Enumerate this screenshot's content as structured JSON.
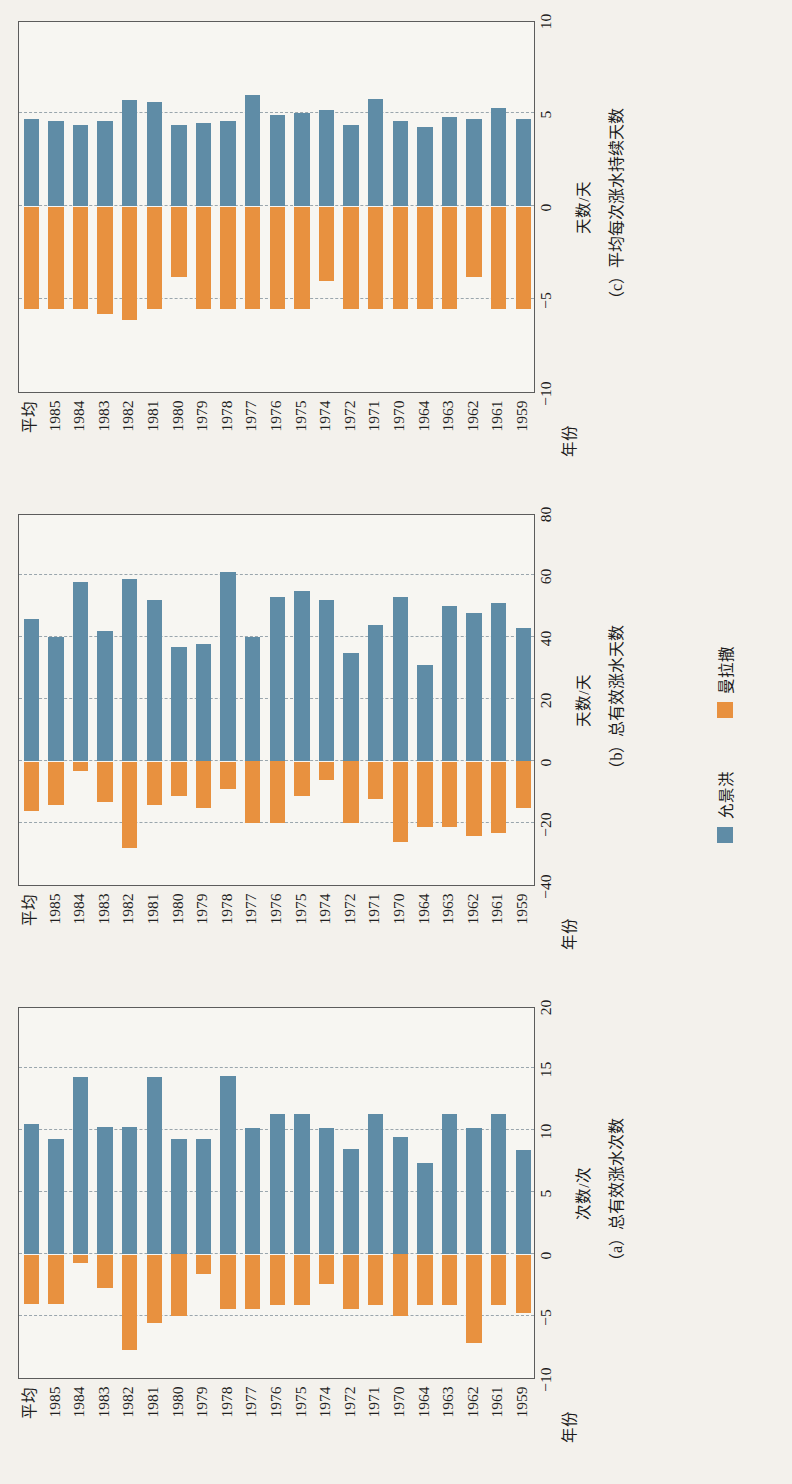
{
  "figure": {
    "axis_label_year": "年份",
    "legend": [
      {
        "name": "允景洪",
        "color": "#5f8ca6",
        "icon": "blue-square-swatch"
      },
      {
        "name": "曼拉撒",
        "color": "#e8913f",
        "icon": "orange-square-swatch"
      }
    ]
  },
  "categories": [
    "平均",
    "1985",
    "1984",
    "1983",
    "1982",
    "1981",
    "1980",
    "1979",
    "1978",
    "1977",
    "1976",
    "1975",
    "1974",
    "1972",
    "1971",
    "1970",
    "1964",
    "1963",
    "1962",
    "1961",
    "1959"
  ],
  "chart_data": [
    {
      "type": "bar",
      "id": "a",
      "title": "（a）总有效涨水次数",
      "xlabel": "次数/次",
      "ylabel": "年份",
      "unit": "次数/次",
      "orientation": "horizontal-diverging",
      "grid": true,
      "xlim": [
        -10,
        20
      ],
      "xticks": [
        -10,
        -5,
        0,
        5,
        10,
        15,
        20
      ],
      "categories": [
        "平均",
        "1985",
        "1984",
        "1983",
        "1982",
        "1981",
        "1980",
        "1979",
        "1978",
        "1977",
        "1976",
        "1975",
        "1974",
        "1972",
        "1971",
        "1970",
        "1964",
        "1963",
        "1962",
        "1961",
        "1959"
      ],
      "series": [
        {
          "name": "允景洪",
          "color": "#5f8ca6",
          "values": [
            10.5,
            9.3,
            14.3,
            10.3,
            10.3,
            14.3,
            9.3,
            9.3,
            14.4,
            10.2,
            11.3,
            11.3,
            10.2,
            8.5,
            11.3,
            9.5,
            7.4,
            11.3,
            10.2,
            11.3,
            8.4
          ]
        },
        {
          "name": "曼拉撒",
          "color": "#e8913f",
          "values": [
            -4.0,
            -4.0,
            -0.7,
            -2.7,
            -7.7,
            -5.5,
            -5.0,
            -1.6,
            -4.4,
            -4.4,
            -4.1,
            -4.1,
            -2.4,
            -4.4,
            -4.1,
            -5.0,
            -4.1,
            -4.1,
            -7.1,
            -4.1,
            -4.7
          ]
        }
      ]
    },
    {
      "type": "bar",
      "id": "b",
      "title": "（b）总有效涨水天数",
      "xlabel": "天数/天",
      "ylabel": "年份",
      "unit": "天数/天",
      "orientation": "horizontal-diverging",
      "grid": true,
      "xlim": [
        -40,
        80
      ],
      "xticks": [
        -40,
        -20,
        0,
        20,
        40,
        60,
        80
      ],
      "categories": [
        "平均",
        "1985",
        "1984",
        "1983",
        "1982",
        "1981",
        "1980",
        "1979",
        "1978",
        "1977",
        "1976",
        "1975",
        "1974",
        "1972",
        "1971",
        "1970",
        "1964",
        "1963",
        "1962",
        "1961",
        "1959"
      ],
      "series": [
        {
          "name": "允景洪",
          "color": "#5f8ca6",
          "values": [
            46,
            40,
            58,
            42,
            59,
            52,
            37,
            38,
            61,
            40,
            53,
            55,
            52,
            35,
            44,
            53,
            31,
            50,
            48,
            51,
            43
          ]
        },
        {
          "name": "曼拉撒",
          "color": "#e8913f",
          "values": [
            -16,
            -14,
            -3,
            -13,
            -28,
            -14,
            -11,
            -15,
            -9,
            -20,
            -20,
            -11,
            -6,
            -20,
            -12,
            -26,
            -21,
            -21,
            -24,
            -23,
            -15
          ]
        }
      ]
    },
    {
      "type": "bar",
      "id": "c",
      "title": "（c）平均每次涨水持续天数",
      "xlabel": "天数/天",
      "ylabel": "年份",
      "unit": "天数/天",
      "orientation": "horizontal-diverging",
      "grid": true,
      "xlim": [
        -10,
        10
      ],
      "xticks": [
        -10,
        -5,
        0,
        5,
        10
      ],
      "categories": [
        "平均",
        "1985",
        "1984",
        "1983",
        "1982",
        "1981",
        "1980",
        "1979",
        "1978",
        "1977",
        "1976",
        "1975",
        "1974",
        "1972",
        "1971",
        "1970",
        "1964",
        "1963",
        "1962",
        "1961",
        "1959"
      ],
      "series": [
        {
          "name": "允景洪",
          "color": "#5f8ca6",
          "values": [
            4.7,
            4.6,
            4.4,
            4.6,
            5.7,
            5.6,
            4.4,
            4.5,
            4.6,
            6.0,
            4.9,
            5.0,
            5.2,
            4.4,
            5.8,
            4.6,
            4.3,
            4.8,
            4.7,
            5.3,
            4.7
          ]
        },
        {
          "name": "曼拉撒",
          "color": "#e8913f",
          "values": [
            -5.5,
            -5.5,
            -5.5,
            -5.8,
            -6.1,
            -5.5,
            -3.8,
            -5.5,
            -5.5,
            -5.5,
            -5.5,
            -5.5,
            -4.0,
            -5.5,
            -5.5,
            -5.5,
            -5.5,
            -5.5,
            -3.8,
            -5.5,
            -5.5
          ]
        }
      ]
    }
  ]
}
